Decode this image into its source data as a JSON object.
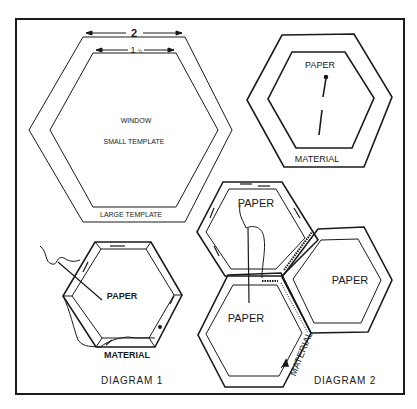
{
  "figure": {
    "labels": {
      "dim_large": "2",
      "dim_small_whole": "1",
      "dim_small_frac": "1/2",
      "window": "WINDOW",
      "small_template": "SMALL TEMPLATE",
      "large_template": "LARGE TEMPLATE",
      "paper_top_right": "PAPER",
      "material_top_right": "MATERIAL",
      "paper_d1": "PAPER",
      "material_d1": "MATERIAL",
      "diagram1": "DIAGRAM 1",
      "paper_d2_top": "PAPER",
      "paper_d2_right": "PAPER",
      "paper_d2_bottom": "PAPER",
      "material_d2": "MATERIAL",
      "diagram2": "DIAGRAM 2"
    },
    "colors": {
      "ink": "#1a1a1a",
      "background": "#ffffff"
    }
  }
}
